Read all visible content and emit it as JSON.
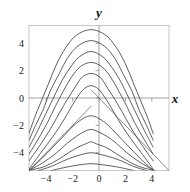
{
  "chart_data": {
    "type": "line",
    "title": "",
    "subtitle": "",
    "xlabel": "x",
    "ylabel": "y",
    "xlim": [
      -5.3,
      5.3
    ],
    "ylim": [
      -5.3,
      5.3
    ],
    "xticks": [
      -4,
      -2,
      0,
      2,
      4
    ],
    "yticks": [
      -4,
      -2,
      0,
      2,
      4
    ],
    "xtick_labels": [
      "-4",
      "-2",
      "0",
      "2",
      "4"
    ],
    "ytick_labels": [
      "-4",
      "-2",
      "0",
      "2",
      "4"
    ],
    "grid": false,
    "legend": null,
    "legend_position": "none",
    "frame": true,
    "axes_through_origin": true,
    "series": [
      {
        "name": "contour-1",
        "peak_xy": [
          -0.6,
          0.9
        ],
        "points": [
          [
            -5.3,
            -5.2
          ],
          [
            -4.4,
            -4.0
          ],
          [
            -3.4,
            -2.7
          ],
          [
            -2.6,
            -1.5
          ],
          [
            -2.0,
            -0.5
          ],
          [
            -1.5,
            0.25
          ],
          [
            -1.1,
            0.7
          ],
          [
            -0.6,
            0.9
          ],
          [
            -0.1,
            0.7
          ],
          [
            0.3,
            0.25
          ],
          [
            0.8,
            -0.5
          ],
          [
            1.4,
            -1.5
          ],
          [
            2.2,
            -2.7
          ],
          [
            3.2,
            -4.0
          ],
          [
            4.1,
            -5.2
          ]
        ]
      },
      {
        "name": "contour-2",
        "peak_xy": [
          -0.6,
          1.8
        ],
        "points": [
          [
            -5.3,
            -4.6
          ],
          [
            -4.5,
            -3.5
          ],
          [
            -3.7,
            -2.3
          ],
          [
            -3.0,
            -1.1
          ],
          [
            -2.4,
            -0.1
          ],
          [
            -1.8,
            0.8
          ],
          [
            -1.3,
            1.5
          ],
          [
            -0.6,
            1.8
          ],
          [
            0.1,
            1.5
          ],
          [
            0.6,
            0.8
          ],
          [
            1.2,
            -0.1
          ],
          [
            1.8,
            -1.1
          ],
          [
            2.5,
            -2.3
          ],
          [
            3.3,
            -3.5
          ],
          [
            4.1,
            -4.6
          ]
        ]
      },
      {
        "name": "contour-3",
        "peak_xy": [
          -0.6,
          2.6
        ],
        "points": [
          [
            -5.3,
            -4.1
          ],
          [
            -4.6,
            -3.0
          ],
          [
            -3.9,
            -1.8
          ],
          [
            -3.3,
            -0.6
          ],
          [
            -2.7,
            0.5
          ],
          [
            -2.1,
            1.5
          ],
          [
            -1.4,
            2.3
          ],
          [
            -0.6,
            2.6
          ],
          [
            0.2,
            2.3
          ],
          [
            0.9,
            1.5
          ],
          [
            1.5,
            0.5
          ],
          [
            2.1,
            -0.6
          ],
          [
            2.7,
            -1.8
          ],
          [
            3.4,
            -3.0
          ],
          [
            4.1,
            -4.1
          ]
        ]
      },
      {
        "name": "contour-4",
        "peak_xy": [
          -0.6,
          3.4
        ],
        "points": [
          [
            -5.3,
            -3.6
          ],
          [
            -4.7,
            -2.5
          ],
          [
            -4.1,
            -1.3
          ],
          [
            -3.5,
            -0.1
          ],
          [
            -2.9,
            1.1
          ],
          [
            -2.2,
            2.2
          ],
          [
            -1.5,
            3.0
          ],
          [
            -0.6,
            3.4
          ],
          [
            0.3,
            3.0
          ],
          [
            1.0,
            2.2
          ],
          [
            1.7,
            1.1
          ],
          [
            2.3,
            -0.1
          ],
          [
            2.9,
            -1.3
          ],
          [
            3.5,
            -2.5
          ],
          [
            4.1,
            -3.6
          ]
        ]
      },
      {
        "name": "contour-5",
        "peak_xy": [
          -0.6,
          4.2
        ],
        "points": [
          [
            -5.3,
            -3.1
          ],
          [
            -4.8,
            -2.0
          ],
          [
            -4.2,
            -0.8
          ],
          [
            -3.7,
            0.5
          ],
          [
            -3.0,
            1.8
          ],
          [
            -2.4,
            2.9
          ],
          [
            -1.6,
            3.8
          ],
          [
            -0.6,
            4.2
          ],
          [
            0.4,
            3.8
          ],
          [
            1.2,
            2.9
          ],
          [
            1.8,
            1.8
          ],
          [
            2.5,
            0.5
          ],
          [
            3.0,
            -0.8
          ],
          [
            3.6,
            -2.0
          ],
          [
            4.1,
            -3.1
          ]
        ]
      },
      {
        "name": "contour-6",
        "peak_xy": [
          -0.6,
          5.0
        ],
        "points": [
          [
            -5.3,
            -2.6
          ],
          [
            -4.9,
            -1.5
          ],
          [
            -4.4,
            -0.3
          ],
          [
            -3.8,
            1.1
          ],
          [
            -3.2,
            2.5
          ],
          [
            -2.5,
            3.7
          ],
          [
            -1.7,
            4.6
          ],
          [
            -0.6,
            5.0
          ],
          [
            0.5,
            4.6
          ],
          [
            1.3,
            3.7
          ],
          [
            2.0,
            2.5
          ],
          [
            2.6,
            1.1
          ],
          [
            3.2,
            -0.3
          ],
          [
            3.7,
            -1.5
          ],
          [
            4.1,
            -2.6
          ]
        ]
      },
      {
        "name": "contour-7-lower",
        "peak_xy": [
          -0.6,
          -1.3
        ],
        "points": [
          [
            -5.3,
            -5.3
          ],
          [
            -4.3,
            -4.4
          ],
          [
            -3.4,
            -3.5
          ],
          [
            -2.6,
            -2.7
          ],
          [
            -1.9,
            -2.0
          ],
          [
            -1.2,
            -1.5
          ],
          [
            -0.6,
            -1.3
          ],
          [
            0.0,
            -1.5
          ],
          [
            0.7,
            -2.0
          ],
          [
            1.4,
            -2.7
          ],
          [
            2.2,
            -3.5
          ],
          [
            3.1,
            -4.4
          ],
          [
            4.1,
            -5.3
          ]
        ]
      },
      {
        "name": "contour-8-lower",
        "peak_xy": [
          -0.6,
          -2.3
        ],
        "points": [
          [
            -5.3,
            -5.3
          ],
          [
            -4.2,
            -4.7
          ],
          [
            -3.2,
            -4.0
          ],
          [
            -2.4,
            -3.3
          ],
          [
            -1.7,
            -2.8
          ],
          [
            -1.1,
            -2.45
          ],
          [
            -0.6,
            -2.3
          ],
          [
            -0.1,
            -2.45
          ],
          [
            0.6,
            -2.8
          ],
          [
            1.3,
            -3.3
          ],
          [
            2.1,
            -4.0
          ],
          [
            3.1,
            -4.7
          ],
          [
            4.2,
            -5.3
          ]
        ]
      },
      {
        "name": "contour-9-lower",
        "peak_xy": [
          -0.6,
          -3.2
        ],
        "points": [
          [
            -5.3,
            -5.3
          ],
          [
            -4.1,
            -5.0
          ],
          [
            -3.1,
            -4.5
          ],
          [
            -2.3,
            -4.0
          ],
          [
            -1.6,
            -3.6
          ],
          [
            -1.0,
            -3.35
          ],
          [
            -0.6,
            -3.2
          ],
          [
            -0.2,
            -3.35
          ],
          [
            0.5,
            -3.6
          ],
          [
            1.2,
            -4.0
          ],
          [
            2.0,
            -4.5
          ],
          [
            3.0,
            -5.0
          ],
          [
            4.2,
            -5.3
          ]
        ]
      },
      {
        "name": "contour-10-lower",
        "peak_xy": [
          -0.6,
          -4.0
        ],
        "points": [
          [
            -4.6,
            -5.3
          ],
          [
            -3.6,
            -5.0
          ],
          [
            -2.7,
            -4.6
          ],
          [
            -1.9,
            -4.3
          ],
          [
            -1.2,
            -4.1
          ],
          [
            -0.6,
            -4.0
          ],
          [
            0.0,
            -4.1
          ],
          [
            0.8,
            -4.3
          ],
          [
            1.7,
            -4.6
          ],
          [
            2.6,
            -5.0
          ],
          [
            3.6,
            -5.3
          ]
        ]
      },
      {
        "name": "contour-11-lower",
        "peak_xy": [
          -0.6,
          -4.8
        ],
        "points": [
          [
            -3.6,
            -5.3
          ],
          [
            -2.7,
            -5.1
          ],
          [
            -1.9,
            -4.95
          ],
          [
            -1.2,
            -4.85
          ],
          [
            -0.6,
            -4.8
          ],
          [
            0.0,
            -4.85
          ],
          [
            0.8,
            -4.95
          ],
          [
            1.7,
            -5.1
          ],
          [
            2.6,
            -5.3
          ]
        ]
      },
      {
        "name": "asymptote-left",
        "points": [
          [
            -5.3,
            -5.3
          ],
          [
            -0.6,
            -0.6
          ]
        ]
      },
      {
        "name": "asymptote-right",
        "points": [
          [
            5.3,
            -5.3
          ],
          [
            -0.6,
            0.6
          ]
        ]
      }
    ]
  },
  "axes": {
    "x_label": "x",
    "y_label": "y",
    "x_tick_labels": [
      "-4",
      "-2",
      "0",
      "2",
      "4"
    ],
    "y_tick_labels": [
      "4",
      "2",
      "0",
      "-2",
      "-4"
    ]
  },
  "colors": {
    "curve": "#2b2b2b",
    "axis": "#8c8c8c",
    "frame": "#b8b8b8",
    "text": "#1a1a1a",
    "background": "#ffffff"
  }
}
